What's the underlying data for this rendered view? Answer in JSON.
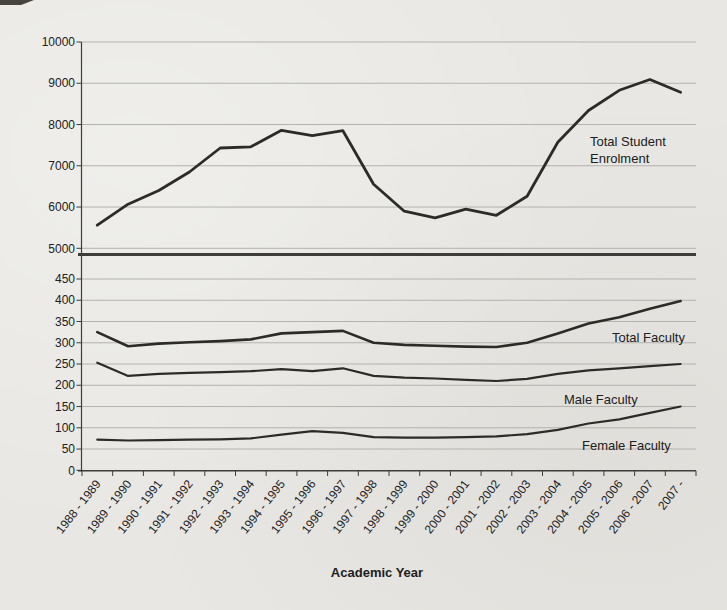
{
  "page": {
    "type": "scanned-figure",
    "background_color": "#e8e7e3"
  },
  "colors": {
    "line": "#2c2b28",
    "grid": "#b3b2ae",
    "axis": "#3e3d3a",
    "text": "#21201d"
  },
  "chart_data": [
    {
      "type": "line",
      "title": "",
      "categories": [
        "1988 - 1989",
        "1989 - 1990",
        "1990 - 1991",
        "1991 - 1992",
        "1992 - 1993",
        "1993 - 1994",
        "1994 - 1995",
        "1995 - 1996",
        "1996 - 1997",
        "1997 - 1998",
        "1998 - 1999",
        "1999 - 2000",
        "2000 - 2001",
        "2001 - 2002",
        "2002 - 2003",
        "2003 - 2004",
        "2004 - 2005",
        "2005 - 2006",
        "2006 - 2007",
        "2007 -"
      ],
      "series": [
        {
          "name": "Total Student Enrolment",
          "values": [
            5560,
            6070,
            6400,
            6850,
            7430,
            7460,
            7860,
            7730,
            7850,
            6550,
            5900,
            5740,
            5950,
            5800,
            6260,
            7570,
            8340,
            8830,
            9090,
            8780
          ]
        }
      ],
      "annotation_lines": [
        "Total Student",
        "Enrolment"
      ],
      "xlabel": "",
      "ylabel": "",
      "ylim": [
        5000,
        10000
      ],
      "ytick_step": 1000,
      "grid": true,
      "legend": "none"
    },
    {
      "type": "line",
      "title": "",
      "categories": [
        "1988 - 1989",
        "1989 - 1990",
        "1990 - 1991",
        "1991 - 1992",
        "1992 - 1993",
        "1993 - 1994",
        "1994 - 1995",
        "1995 - 1996",
        "1996 - 1997",
        "1997 - 1998",
        "1998 - 1999",
        "1999 - 2000",
        "2000 - 2001",
        "2001 - 2002",
        "2002 - 2003",
        "2003 - 2004",
        "2004 - 2005",
        "2005 - 2006",
        "2006 - 2007",
        "2007 -"
      ],
      "series": [
        {
          "name": "Total Faculty",
          "values": [
            325,
            292,
            298,
            301,
            304,
            308,
            322,
            325,
            328,
            300,
            295,
            293,
            291,
            290,
            300,
            322,
            345,
            360,
            380,
            398
          ]
        },
        {
          "name": "Male Faculty",
          "values": [
            253,
            222,
            227,
            229,
            231,
            233,
            238,
            233,
            240,
            222,
            218,
            216,
            213,
            210,
            215,
            227,
            235,
            240,
            245,
            250
          ]
        },
        {
          "name": "Female Faculty",
          "values": [
            72,
            70,
            71,
            72,
            73,
            75,
            84,
            92,
            88,
            78,
            77,
            77,
            78,
            80,
            85,
            95,
            110,
            120,
            135,
            150
          ]
        }
      ],
      "xlabel": "Academic Year",
      "ylabel": "",
      "ylim": [
        0,
        450
      ],
      "ytick_step": 50,
      "grid": true,
      "legend": "none"
    }
  ]
}
